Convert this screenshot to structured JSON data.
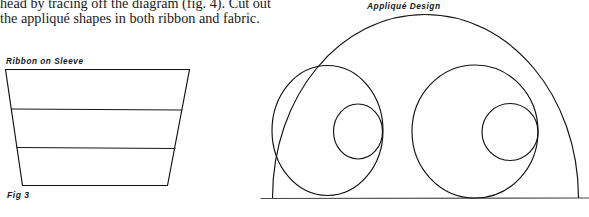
{
  "document": {
    "body_text": {
      "lines": [
        "head by tracing off the diagram (fig. 4). Cut out",
        "the appliqué shapes in both ribbon and fabric."
      ],
      "line1": "head by tracing off the diagram (fig. 4). Cut out",
      "line2": "the appliqué shapes in both ribbon and fabric."
    }
  },
  "figures": {
    "ribbon_sleeve": {
      "label": "Ribbon on Sleeve",
      "caption": "Fig 3",
      "shape": "trapezoid",
      "divider_count": 2
    },
    "applique": {
      "label": "Appliqué Design",
      "shape": "dome-with-circles",
      "large_circle_count": 2,
      "small_circle_count": 2
    }
  },
  "colors": {
    "ink": "#111111",
    "paper": "#ffffff",
    "text": "#1a1a1a"
  }
}
